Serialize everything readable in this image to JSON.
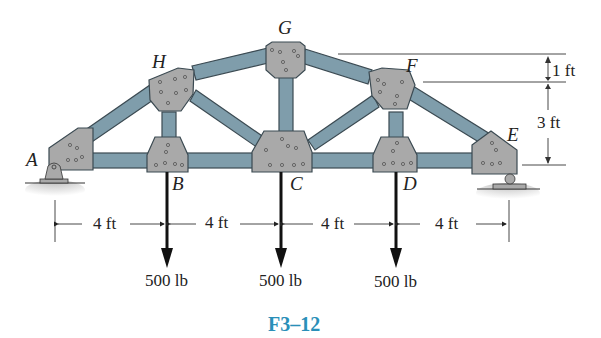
{
  "figure": {
    "caption": "F3–12",
    "joints": {
      "A": "A",
      "B": "B",
      "C": "C",
      "D": "D",
      "E": "E",
      "F": "F",
      "G": "G",
      "H": "H"
    },
    "horizontal_dimensions": [
      "4 ft",
      "4 ft",
      "4 ft",
      "4 ft"
    ],
    "vertical_dimensions": [
      "1 ft",
      "3 ft"
    ],
    "loads": [
      {
        "joint": "B",
        "label": "500 lb"
      },
      {
        "joint": "C",
        "label": "500 lb"
      },
      {
        "joint": "D",
        "label": "500 lb"
      }
    ],
    "supports": {
      "A": "pin",
      "E": "roller"
    },
    "colors": {
      "member": "#7f9dab",
      "member_edge": "#3b4a52",
      "gusset": "#a9a9a9",
      "caption": "#2a8fb8"
    }
  }
}
